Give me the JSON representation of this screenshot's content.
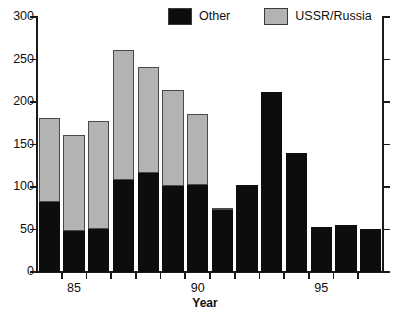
{
  "chart_data": {
    "type": "bar",
    "stacked": true,
    "title": "",
    "xlabel": "Year",
    "ylabel": "",
    "categories": [
      "84",
      "85",
      "86",
      "87",
      "88",
      "89",
      "90",
      "91",
      "92",
      "93",
      "94",
      "95",
      "96",
      "97"
    ],
    "x_tick_labels": [
      {
        "category": "85",
        "label": "85"
      },
      {
        "category": "90",
        "label": "90"
      },
      {
        "category": "95",
        "label": "95"
      }
    ],
    "series": [
      {
        "name": "Other",
        "color": "#0d0d0d",
        "values": [
          82,
          48,
          51,
          108,
          116,
          101,
          102,
          73,
          102,
          212,
          140,
          53,
          55,
          51
        ]
      },
      {
        "name": "USSR/Russia",
        "color": "#b3b3b3",
        "values": [
          99,
          113,
          127,
          153,
          125,
          113,
          84,
          2,
          0,
          0,
          0,
          0,
          0,
          0
        ]
      }
    ],
    "totals": [
      181,
      161,
      178,
      261,
      241,
      214,
      186,
      75,
      102,
      212,
      140,
      53,
      55,
      51
    ],
    "ylim": [
      0,
      300
    ],
    "y_ticks": [
      0,
      50,
      100,
      150,
      200,
      250,
      300
    ],
    "grid": false,
    "legend_position": "top-center"
  },
  "legend": {
    "entries": [
      {
        "label": "Other",
        "swatch": "black-swatch"
      },
      {
        "label": "USSR/Russia",
        "swatch": "gray-swatch"
      }
    ]
  },
  "axis": {
    "x_title": "Year"
  }
}
